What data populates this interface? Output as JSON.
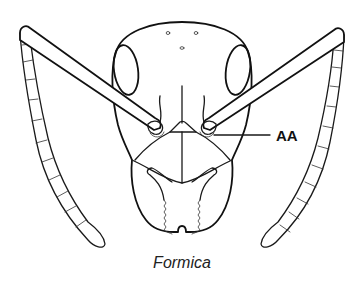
{
  "diagram": {
    "caption": "Formica",
    "labels": [
      {
        "id": "AA",
        "text": "AA",
        "points_to": "antennal socket (right)"
      }
    ],
    "parts": [
      "head-capsule",
      "compound-eye-left",
      "compound-eye-right",
      "ocelli",
      "antenna-left-scape",
      "antenna-left-funiculus",
      "antenna-right-scape",
      "antenna-right-funiculus",
      "frontal-carinae",
      "clypeus",
      "mandibles"
    ],
    "colors": {
      "line": "#1a1a1a",
      "background": "#ffffff"
    }
  }
}
